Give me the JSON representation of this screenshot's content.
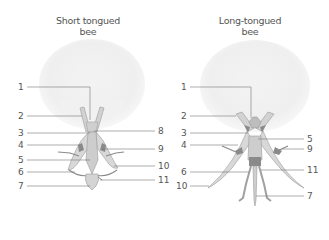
{
  "panels": [
    {
      "title_line1": "Short tongued",
      "title_line2": "bee",
      "labels_left": [
        "1",
        "2",
        "3",
        "4",
        "5",
        "6",
        "7"
      ],
      "labels_right": [
        "8",
        "9",
        "10",
        "11"
      ]
    },
    {
      "title_line1": "Long-tongued",
      "title_line2": "bee",
      "labels_left": [
        "1",
        "2",
        "3",
        "4",
        "6",
        "10"
      ],
      "labels_right": [
        "5",
        "9",
        "11",
        "7"
      ]
    }
  ],
  "colors": {
    "head": "#f1f1f1",
    "part_fill": "#d6d6d6",
    "part_dark": "#8a8a8a",
    "line": "#666666"
  }
}
